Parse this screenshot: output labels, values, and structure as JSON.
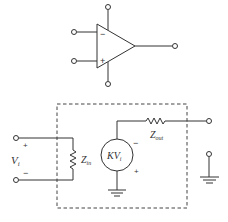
{
  "opamp": {
    "inverting_sign": "−",
    "noninverting_sign": "+"
  },
  "model": {
    "input_label": "V",
    "input_sub": "i",
    "input_plus": "+",
    "input_minus": "−",
    "zin_label": "Z",
    "zin_sub": "in",
    "source_label": "KV",
    "source_sub": "i",
    "source_minus": "−",
    "source_plus": "+",
    "zout_label": "Z",
    "zout_sub": "out"
  },
  "colors": {
    "stroke": "#333333",
    "background": "#ffffff"
  }
}
